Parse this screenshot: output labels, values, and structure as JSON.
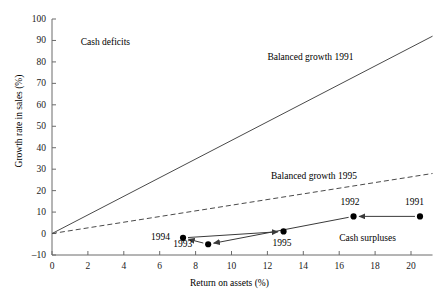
{
  "chart_data": {
    "type": "scatter",
    "title": "",
    "xlabel": "Return on assets (%)",
    "ylabel": "Growth rate in sales (%)",
    "xlim": [
      0,
      21.2
    ],
    "ylim": [
      -10,
      100
    ],
    "xticks": [
      0,
      2,
      4,
      6,
      8,
      10,
      12,
      14,
      16,
      18,
      20
    ],
    "yticks": [
      -10,
      0,
      10,
      20,
      30,
      40,
      50,
      60,
      70,
      80,
      90,
      100
    ],
    "xtick_labels": [
      "0",
      "2",
      "4",
      "6",
      "8",
      "10",
      "12",
      "14",
      "16",
      "18",
      "20"
    ],
    "ytick_labels": [
      "-10",
      "0",
      "10",
      "20",
      "30",
      "40",
      "50",
      "60",
      "70",
      "80",
      "90",
      "100"
    ],
    "grid": false,
    "legend": "none",
    "points": [
      {
        "label": "1991",
        "x": 20.5,
        "y": 8.0,
        "label_dx": -4,
        "label_dy": -13,
        "label_anchor": "middle"
      },
      {
        "label": "1992",
        "x": 16.8,
        "y": 8.0,
        "label_dx": -2,
        "label_dy": -13,
        "label_anchor": "middle"
      },
      {
        "label": "1993",
        "x": 8.7,
        "y": -5.0,
        "label_dx": -13,
        "label_dy": 1,
        "label_anchor": "end"
      },
      {
        "label": "1994",
        "x": 7.3,
        "y": -2.0,
        "label_dx": -10,
        "label_dy": 0,
        "label_anchor": "end"
      },
      {
        "label": "1995",
        "x": 12.9,
        "y": 1.0,
        "label_dx": 0,
        "label_dy": 13,
        "label_anchor": "middle"
      }
    ],
    "path_order": [
      "1991",
      "1992",
      "1993",
      "1994",
      "1995"
    ],
    "arrows": [
      {
        "from": "1991",
        "to": "1992",
        "note": "1991 to 1992 leftward arrow"
      },
      {
        "from": "1992",
        "to": "1993",
        "note": "1992 down-left to 1993"
      },
      {
        "from": "1993",
        "to": "1994",
        "note": "1993 to 1994 short arrow"
      },
      {
        "from": "1994",
        "to": "1995",
        "note": "1994 rightward to 1995"
      }
    ],
    "reference_lines": [
      {
        "name": "Balanced growth 1991",
        "style": "solid",
        "x0": 0,
        "y0": 0,
        "x1": 21.2,
        "y1": 92.0,
        "slope": 4.34
      },
      {
        "name": "Balanced growth 1995",
        "style": "dashed",
        "x0": 0,
        "y0": 0,
        "x1": 21.2,
        "y1": 28.0,
        "slope": 1.32
      }
    ],
    "annotations": [
      {
        "text": "Cash deficits",
        "x": 1.6,
        "y": 89.0,
        "anchor": "start"
      },
      {
        "text": "Balanced growth 1991",
        "x": 12.0,
        "y": 82.0,
        "anchor": "start"
      },
      {
        "text": "Balanced growth 1995",
        "x": 12.2,
        "y": 26.5,
        "anchor": "start"
      },
      {
        "text": "Cash surpluses",
        "x": 16.0,
        "y": -2.5,
        "anchor": "start"
      }
    ]
  },
  "axis": {
    "x_title": "Return on assets (%)",
    "y_title": "Growth rate in sales (%)"
  }
}
